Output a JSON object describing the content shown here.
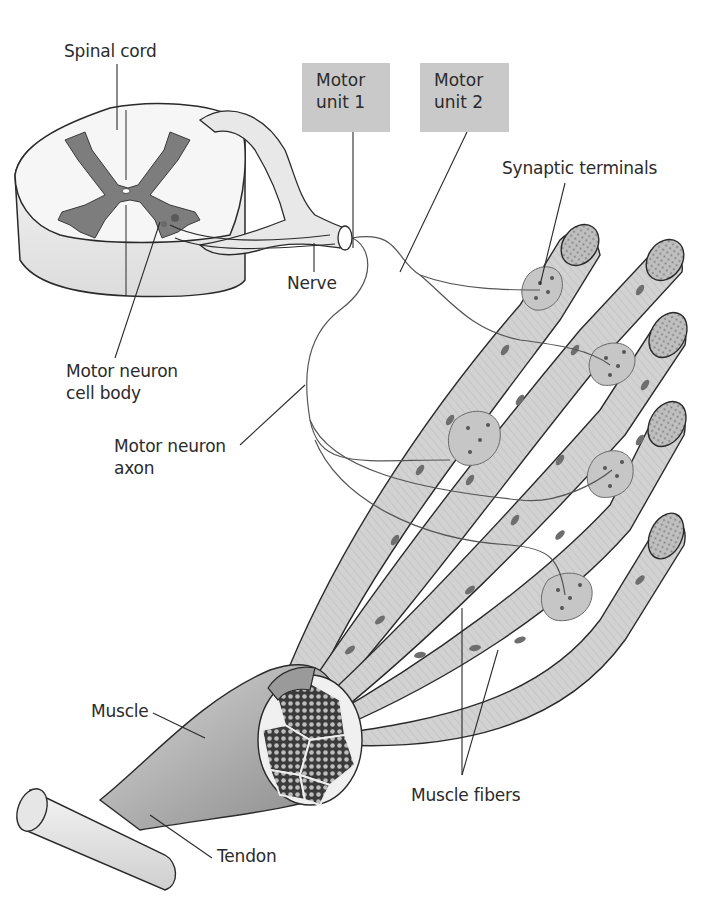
{
  "diagram": {
    "colors": {
      "background": "#ffffff",
      "label_text": "#2b2b2b",
      "box_fill": "#c9c9c9",
      "gray_matter": "#7d7d7d",
      "fiber_fill": "#cfcfcf",
      "outline": "#2a2a2a",
      "nucleus": "#6e6e6e"
    },
    "labels": {
      "spinal_cord": "Spinal cord",
      "motor_unit_1": "Motor\nunit 1",
      "motor_unit_2": "Motor\nunit 2",
      "synaptic_terminals": "Synaptic terminals",
      "nerve": "Nerve",
      "motor_neuron_cell_body": "Motor neuron\ncell body",
      "motor_neuron_axon": "Motor neuron\naxon",
      "muscle": "Muscle",
      "tendon": "Tendon",
      "muscle_fibers": "Muscle fibers"
    },
    "structures": [
      {
        "name": "spinal-cord-cross-section",
        "description": "Spinal cord cross section with butterfly-shaped gray matter and two motor neuron cell bodies"
      },
      {
        "name": "nerve",
        "description": "Nerve leaving the spinal cord ventral/dorsal roots"
      },
      {
        "name": "motor-neuron-axons",
        "count": 2
      },
      {
        "name": "muscle-fibers",
        "count": 5
      },
      {
        "name": "synaptic-terminal-clusters",
        "count": 5
      },
      {
        "name": "muscle-bundle-with-fascicles",
        "fascicle_count": 7
      },
      {
        "name": "tendon"
      }
    ]
  }
}
